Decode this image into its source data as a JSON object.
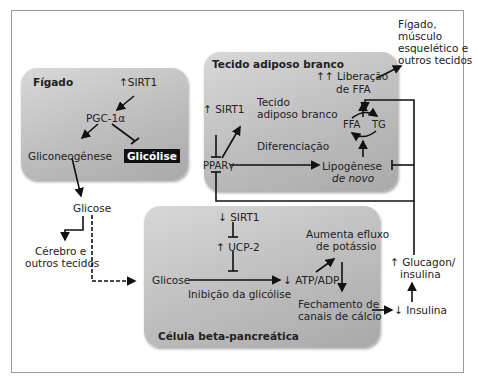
{
  "liver": {
    "title": "Fígado",
    "sirt1": "↑SIRT1",
    "pgc": "PGC-1α",
    "gluconeogenesis": "Gliconeogênese",
    "glycolysis": "Glicólise"
  },
  "adipose": {
    "title": "Tecido adiposo branco",
    "sirt1": "↑ SIRT1",
    "ppar": "PPARγ",
    "wat_line1": "Tecido",
    "wat_line2": "adiposo branco",
    "differentiation": "Diferenciação",
    "ffa_release_line1": "↑↑ Liberação",
    "ffa_release_line2": "de FFA",
    "ffa": "FFA",
    "tg": "TG",
    "lipogenesis_line1": "Lipogênese",
    "lipogenesis_line2": "de novo"
  },
  "targets": {
    "line1": "Fígado,",
    "line2": "músculo",
    "line3": "esquelético e",
    "line4": "outros tecidos"
  },
  "glucose": {
    "label": "Glicose",
    "brain_line1": "Cérebro e",
    "brain_line2": "outros tecidos"
  },
  "beta": {
    "title": "Célula beta-pancreática",
    "sirt1": "↓ SIRT1",
    "ucp2": "↑ UCP-2",
    "glucose": "Glicose",
    "glycolysis_inhibition": "Inibição da glicólise",
    "atp": "↓ ATP/ADP",
    "efflux_line1": "Aumenta efluxo",
    "efflux_line2": "de potássio",
    "calcium_line1": "Fechamento de",
    "calcium_line2": "canais de cálcio"
  },
  "outside": {
    "insulin": "↓ Insulina",
    "glucagon_line1": "↑ Glucagon/",
    "glucagon_line2": "insulina"
  },
  "colors": {
    "box_light": "#d8d8d8",
    "box_dark": "#a9a9a9",
    "frame": "#9a9a9a",
    "highlight_bg": "#111111"
  }
}
